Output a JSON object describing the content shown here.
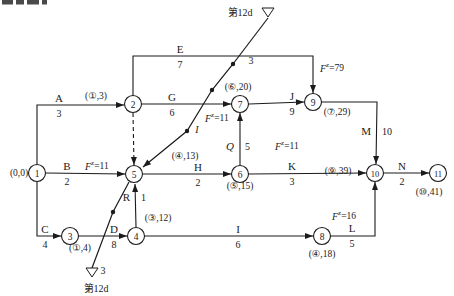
{
  "figure_colors": {
    "line": "#1b1b1b",
    "background": "#ffffff",
    "node_fill": "#ffffff"
  },
  "top_fragment_blobs": [
    [
      2,
      11
    ],
    [
      16,
      8
    ],
    [
      27,
      12
    ],
    [
      42,
      5
    ]
  ],
  "diagram": {
    "nodes": [
      {
        "id": "1",
        "x": 37,
        "y": 173
      },
      {
        "id": "2",
        "x": 133,
        "y": 104
      },
      {
        "id": "3",
        "x": 70,
        "y": 236
      },
      {
        "id": "4",
        "x": 136,
        "y": 236
      },
      {
        "id": "5",
        "x": 134,
        "y": 174
      },
      {
        "id": "6",
        "x": 240,
        "y": 174
      },
      {
        "id": "7",
        "x": 240,
        "y": 104
      },
      {
        "id": "8",
        "x": 322,
        "y": 236
      },
      {
        "id": "9",
        "x": 313,
        "y": 102
      },
      {
        "id": "10",
        "x": 375,
        "y": 173
      },
      {
        "id": "11",
        "x": 438,
        "y": 173
      }
    ],
    "edges": [
      {
        "id": "A",
        "points": [
          [
            37,
            164
          ],
          [
            37,
            105
          ],
          [
            124,
            105
          ]
        ],
        "arrow": true,
        "dashed": false
      },
      {
        "id": "B",
        "points": [
          [
            46,
            173
          ],
          [
            125,
            174
          ]
        ],
        "arrow": true,
        "dashed": false
      },
      {
        "id": "C",
        "points": [
          [
            37,
            182
          ],
          [
            37,
            236
          ],
          [
            61,
            236
          ]
        ],
        "arrow": true,
        "dashed": false
      },
      {
        "id": "D",
        "points": [
          [
            79,
            236
          ],
          [
            127,
            236
          ]
        ],
        "arrow": true,
        "dashed": false
      },
      {
        "id": "R",
        "points": [
          [
            136,
            227
          ],
          [
            135,
            184
          ]
        ],
        "arrow": true,
        "dashed": false
      },
      {
        "id": "dummy-2-5",
        "points": [
          [
            133,
            113
          ],
          [
            134,
            165
          ]
        ],
        "arrow": true,
        "dashed": true
      },
      {
        "id": "E",
        "points": [
          [
            133,
            95
          ],
          [
            133,
            56
          ],
          [
            313,
            56
          ],
          [
            313,
            93
          ]
        ],
        "arrow": true,
        "dashed": false
      },
      {
        "id": "G",
        "points": [
          [
            142,
            104
          ],
          [
            231,
            104
          ]
        ],
        "arrow": true,
        "dashed": false
      },
      {
        "id": "H",
        "points": [
          [
            143,
            174
          ],
          [
            231,
            174
          ]
        ],
        "arrow": true,
        "dashed": false
      },
      {
        "id": "Q",
        "points": [
          [
            240,
            165
          ],
          [
            240,
            113
          ]
        ],
        "arrow": true,
        "dashed": false
      },
      {
        "id": "J",
        "points": [
          [
            249,
            104
          ],
          [
            304,
            102
          ]
        ],
        "arrow": true,
        "dashed": false
      },
      {
        "id": "K",
        "points": [
          [
            249,
            174
          ],
          [
            366,
            173
          ]
        ],
        "arrow": true,
        "dashed": false
      },
      {
        "id": "M",
        "points": [
          [
            322,
            102
          ],
          [
            377,
            102
          ],
          [
            376,
            164
          ]
        ],
        "arrow": true,
        "dashed": false
      },
      {
        "id": "N",
        "points": [
          [
            384,
            173
          ],
          [
            429,
            173
          ]
        ],
        "arrow": true,
        "dashed": false
      },
      {
        "id": "L",
        "points": [
          [
            331,
            236
          ],
          [
            375,
            236
          ],
          [
            375,
            182
          ]
        ],
        "arrow": true,
        "dashed": false
      },
      {
        "id": "I",
        "points": [
          [
            145,
            236
          ],
          [
            313,
            236
          ]
        ],
        "arrow": true,
        "dashed": false
      }
    ],
    "activity_labels": [
      {
        "name": "A",
        "dur": "3",
        "x": 59,
        "y": 105,
        "orient": "h",
        "italic": false
      },
      {
        "name": "B",
        "dur": "2",
        "x": 67,
        "y": 173,
        "orient": "h",
        "italic": false
      },
      {
        "name": "C",
        "dur": "4",
        "x": 45,
        "y": 236,
        "orient": "h",
        "italic": false
      },
      {
        "name": "D",
        "dur": "8",
        "x": 114,
        "y": 236,
        "orient": "h",
        "italic": false
      },
      {
        "name": "E",
        "dur": "7",
        "x": 180,
        "y": 56,
        "orient": "h",
        "italic": false
      },
      {
        "name": "G",
        "dur": "6",
        "x": 172,
        "y": 104,
        "orient": "h",
        "italic": false
      },
      {
        "name": "H",
        "dur": "2",
        "x": 198,
        "y": 174,
        "orient": "h",
        "italic": false
      },
      {
        "name": "I",
        "dur": "6",
        "x": 238,
        "y": 236,
        "orient": "h",
        "italic": false
      },
      {
        "name": "J",
        "dur": "9",
        "x": 292,
        "y": 103,
        "orient": "h",
        "italic": false
      },
      {
        "name": "K",
        "dur": "3",
        "x": 292,
        "y": 173,
        "orient": "h",
        "italic": false
      },
      {
        "name": "L",
        "dur": "5",
        "x": 352,
        "y": 235,
        "orient": "h",
        "italic": false
      },
      {
        "name": "M",
        "dur": "10",
        "x": 377,
        "y": 131,
        "orient": "v",
        "italic": false
      },
      {
        "name": "N",
        "dur": "2",
        "x": 402,
        "y": 173,
        "orient": "h",
        "italic": false
      },
      {
        "name": "Q",
        "dur": "5",
        "x": 240,
        "y": 146,
        "orient": "v",
        "italic": true
      },
      {
        "name": "R",
        "dur": "1",
        "x": 136,
        "y": 197,
        "orient": "v",
        "italic": false
      }
    ],
    "node_time_labels": [
      {
        "text": "(0,0)",
        "x": 19,
        "y": 173
      },
      {
        "text": "(①,3)",
        "x": 96,
        "y": 96
      },
      {
        "text": "(①,4)",
        "x": 80,
        "y": 248
      },
      {
        "text": "(③,12)",
        "x": 158,
        "y": 218
      },
      {
        "text": "(④,13)",
        "x": 185,
        "y": 156
      },
      {
        "text": "(⑤,15)",
        "x": 240,
        "y": 186
      },
      {
        "text": "(⑥,20)",
        "x": 238,
        "y": 87
      },
      {
        "text": "(⑦,29)",
        "x": 337,
        "y": 112
      },
      {
        "text": "(⑨,39)",
        "x": 338,
        "y": 171
      },
      {
        "text": "(⑩,41)",
        "x": 429,
        "y": 192
      },
      {
        "text": "(④,18)",
        "x": 322,
        "y": 254
      }
    ],
    "float_labels": [
      {
        "base": "F",
        "sup": "z",
        "eq": "=11",
        "x": 85,
        "y": 166
      },
      {
        "base": "F",
        "sup": "z",
        "eq": "=11",
        "x": 205,
        "y": 118
      },
      {
        "base": "F",
        "sup": "z",
        "eq": "=11",
        "x": 275,
        "y": 146
      },
      {
        "base": "F",
        "sup": "z",
        "eq": "=79",
        "x": 320,
        "y": 68
      },
      {
        "base": "F",
        "sup": "z",
        "eq": "=16",
        "x": 332,
        "y": 216
      }
    ],
    "front_line": {
      "upper_points": [
        [
          268,
          18
        ],
        [
          233,
          64
        ],
        [
          212,
          90
        ],
        [
          187,
          131
        ],
        [
          143,
          167
        ]
      ],
      "lower_points": [
        [
          129,
          182
        ],
        [
          113,
          212
        ],
        [
          92,
          268
        ]
      ],
      "dots": [
        [
          233,
          64
        ],
        [
          212,
          90
        ],
        [
          187,
          131
        ],
        [
          113,
          212
        ]
      ],
      "triangles": [
        [
          262,
          8,
          274,
          8,
          268,
          17
        ],
        [
          86,
          268,
          98,
          268,
          92,
          277
        ]
      ],
      "labels": [
        {
          "text": "第12d",
          "x": 240,
          "y": 12,
          "italic": false
        },
        {
          "text": "3",
          "x": 251,
          "y": 60,
          "italic": false
        },
        {
          "text": "I",
          "x": 197,
          "y": 129,
          "italic": true
        },
        {
          "text": "3",
          "x": 103,
          "y": 270,
          "italic": false
        },
        {
          "text": "第12d",
          "x": 96,
          "y": 288,
          "italic": false
        }
      ]
    }
  }
}
